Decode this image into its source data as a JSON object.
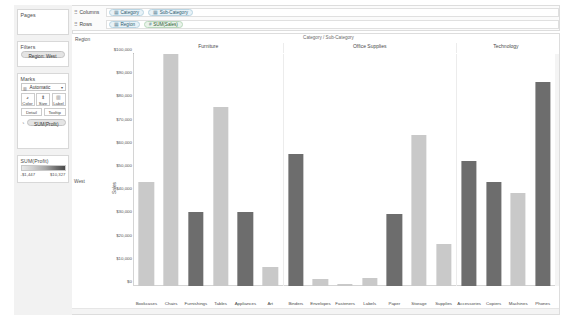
{
  "sidebar": {
    "pages": {
      "title": "Pages"
    },
    "filters": {
      "title": "Filters",
      "pills": [
        "Region: West"
      ]
    },
    "marks": {
      "title": "Marks",
      "type_label": "Automatic",
      "type_glyph": "▥",
      "caret": "▾",
      "buttons": [
        {
          "label": "Color",
          "icon": "◕"
        },
        {
          "label": "Size",
          "icon": "⬍"
        },
        {
          "label": "Label",
          "icon": "▥"
        }
      ],
      "buttons_row2": [
        {
          "label": "Detail"
        },
        {
          "label": "Tooltip"
        }
      ],
      "color_pill": {
        "icon": "◔",
        "label": "SUM(Profit)"
      }
    },
    "legend": {
      "title": "SUM(Profit)",
      "min": "-$1,447",
      "max": "$10,327"
    }
  },
  "shelves": {
    "columns": {
      "label": "Columns",
      "glyph": "⠿",
      "pills": [
        {
          "text": "Category",
          "glyph": "▦",
          "kind": "dimension"
        },
        {
          "text": "Sub-Category",
          "glyph": "▦",
          "kind": "dimension"
        }
      ]
    },
    "rows": {
      "label": "Rows",
      "glyph": "⠿",
      "pills": [
        {
          "text": "Region",
          "glyph": "▦",
          "kind": "dimension"
        },
        {
          "text": "SUM(Sales)",
          "glyph": "#",
          "kind": "measure"
        }
      ]
    }
  },
  "view": {
    "corner_label": "Region",
    "header_title": "Category / Sub-Category",
    "row_header": "West",
    "axis_title": "Sales"
  },
  "colors": {
    "bar_light": "#c9c9c9",
    "bar_mid": "#b0b0b0",
    "bar_dark": "#6d6d6d",
    "axis": "#d4d4d4",
    "panel_bg": "#f7f7f7",
    "dimension_pill": "#e8f2f7",
    "measure_pill": "#e9f3ea"
  },
  "chart_data": {
    "type": "bar",
    "title": "Category / Sub-Category",
    "xlabel": "",
    "ylabel": "Sales",
    "ylim": [
      0,
      100000
    ],
    "yticks": [
      "$0",
      "$10,000",
      "$20,000",
      "$30,000",
      "$40,000",
      "$50,000",
      "$60,000",
      "$70,000",
      "$80,000",
      "$90,000",
      "$100,000"
    ],
    "grid": false,
    "legend_position": "left-sidebar",
    "color_encoding": "SUM(Profit)",
    "groups": [
      {
        "name": "Furniture",
        "categories": [
          "Bookcases",
          "Chairs",
          "Furnishings",
          "Tables",
          "Appliances",
          "Art"
        ],
        "values": [
          45000,
          100000,
          32000,
          77000,
          32000,
          8000
        ],
        "shades": [
          "light",
          "light",
          "dark",
          "light",
          "dark",
          "light"
        ]
      },
      {
        "name": "Office Supplies",
        "categories": [
          "Binders",
          "Envelopes",
          "Fasteners",
          "Labels",
          "Paper",
          "Storage",
          "Supplies"
        ],
        "values": [
          57000,
          3000,
          1000,
          3500,
          31000,
          65000,
          18000
        ],
        "shades": [
          "dark",
          "light",
          "light",
          "light",
          "dark",
          "light",
          "light"
        ]
      },
      {
        "name": "Technology",
        "categories": [
          "Accessories",
          "Copiers",
          "Machines",
          "Phones"
        ],
        "values": [
          54000,
          45000,
          40000,
          88000
        ],
        "shades": [
          "dark",
          "dark",
          "light",
          "dark"
        ]
      }
    ]
  }
}
